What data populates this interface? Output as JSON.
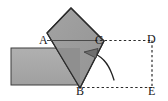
{
  "figure": {
    "background_color": "#ffffff",
    "width": 168,
    "height": 101,
    "labels": {
      "A": "A",
      "B": "B",
      "C": "C",
      "D": "D",
      "E": "E"
    },
    "colors": {
      "bar_fill": "#a8a8a8",
      "bar_stroke": "#3c3c3c",
      "square_fill": "#9a9a9a",
      "square_fill_light": "#ababab",
      "square_stroke": "#2b2b2b",
      "overlap_fill": "#8a8a8a",
      "dashed_stroke": "#2b2b2b",
      "arrow_stroke": "#222222",
      "arrow_fill": "#6e6e6e",
      "label_color": "#1a1a1a"
    },
    "shapes": {
      "bar": {
        "name": "horizontal-gray-bar",
        "x": 11,
        "y": 48,
        "width": 69,
        "height": 37
      },
      "tilted_square": {
        "name": "tilted-square",
        "points": "47,33 71,8 104,41 80,88",
        "rotation_deg": 44
      },
      "overlap_triangle": {
        "name": "square-bar-overlap",
        "points": "47,33 95,40 80,88"
      },
      "dashed_rectangle": {
        "name": "dashed-rectangle-CDEB",
        "points": "95,40 152,40 152,88 80,88"
      },
      "arrow": {
        "name": "curved-rotation-arrow",
        "path": "M 113,79 C 108,66 104,58 92,54",
        "head_points": "85,52 96,50 94,59"
      }
    }
  }
}
